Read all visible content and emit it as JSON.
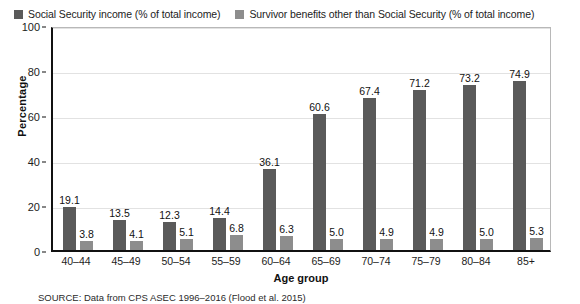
{
  "chart_data": {
    "type": "bar",
    "title": "",
    "xlabel": "Age group",
    "ylabel": "Percentage",
    "ylim": [
      0,
      100
    ],
    "yticks": [
      0,
      20,
      40,
      60,
      80,
      100
    ],
    "grid": true,
    "legend_position": "top-left",
    "categories": [
      "40–44",
      "45–49",
      "50–54",
      "55–59",
      "60–64",
      "65–69",
      "70–74",
      "75–79",
      "80–84",
      "85+"
    ],
    "series": [
      {
        "name": "Social Security income (% of total income)",
        "color": "#5a5a5a",
        "values": [
          19.1,
          13.5,
          12.3,
          14.4,
          36.1,
          60.6,
          67.4,
          71.2,
          73.2,
          74.9
        ],
        "labels": [
          "19.1",
          "13.5",
          "12.3",
          "14.4",
          "36.1",
          "60.6",
          "67.4",
          "71.2",
          "73.2",
          "74.9"
        ]
      },
      {
        "name": "Survivor benefits other than Social Security (% of total income)",
        "color": "#8d8d8d",
        "values": [
          3.8,
          4.1,
          5.1,
          6.8,
          6.3,
          5.0,
          4.9,
          4.9,
          5.0,
          5.3
        ],
        "labels": [
          "3.8",
          "4.1",
          "5.1",
          "6.8",
          "6.3",
          "5.0",
          "4.9",
          "4.9",
          "5.0",
          "5.3"
        ]
      }
    ]
  },
  "legend": {
    "items": [
      {
        "label": "Social Security income (% of total income)",
        "swatch_color": "#5a5a5a"
      },
      {
        "label": "Survivor benefits other than Social Security (% of total income)",
        "swatch_color": "#8d8d8d"
      }
    ]
  },
  "axes": {
    "y_title": "Percentage",
    "x_title": "Age group",
    "y_tick_labels": [
      "100",
      "80",
      "60",
      "40",
      "20",
      "0"
    ]
  },
  "footer": {
    "source": "SOURCE: Data from CPS ASEC 1996–2016 (Flood et al. 2015)"
  }
}
